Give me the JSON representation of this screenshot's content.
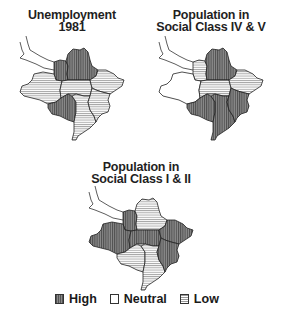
{
  "chart_data": {
    "type": "choropleth",
    "title": "",
    "legend": {
      "position": "bottom",
      "entries": [
        {
          "key": "high",
          "label": "High"
        },
        {
          "key": "neutral",
          "label": "Neutral"
        },
        {
          "key": "low",
          "label": "Low"
        }
      ]
    },
    "regions": [
      "northwest",
      "north",
      "west",
      "center",
      "east",
      "southwest",
      "south_center",
      "southeast"
    ],
    "maps": [
      {
        "id": "unemployment",
        "title_line1": "Unemployment",
        "title_line2": "1981",
        "values": {
          "northwest": "high",
          "north": "high",
          "west": "low",
          "center": "low",
          "east": "low",
          "southwest": "high",
          "south_center": "low",
          "southeast": "low"
        }
      },
      {
        "id": "social_class_iv_v",
        "title_line1": "Population in",
        "title_line2": "Social Class IV & V",
        "values": {
          "northwest": "low",
          "north": "high",
          "west": "neutral",
          "center": "low",
          "east": "low",
          "southwest": "high",
          "south_center": "high",
          "southeast": "high"
        }
      },
      {
        "id": "social_class_i_ii",
        "title_line1": "Population in",
        "title_line2": "Social Class I & II",
        "values": {
          "northwest": "high",
          "north": "low",
          "west": "high",
          "center": "high",
          "east": "high",
          "southwest": "low",
          "south_center": "low",
          "southeast": "high"
        }
      }
    ]
  },
  "legend": {
    "high": "High",
    "neutral": "Neutral",
    "low": "Low"
  }
}
